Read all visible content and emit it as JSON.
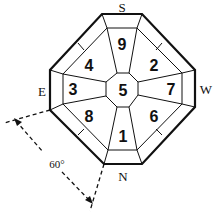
{
  "diagram": {
    "directions": {
      "top": "S",
      "right": "W",
      "bottom": "N",
      "left": "E"
    },
    "sectors": [
      {
        "id": "center",
        "label": "5"
      },
      {
        "id": "top",
        "label": "9"
      },
      {
        "id": "top-right",
        "label": "2"
      },
      {
        "id": "right",
        "label": "7"
      },
      {
        "id": "bottom-right",
        "label": "6"
      },
      {
        "id": "bottom",
        "label": "1"
      },
      {
        "id": "bottom-left",
        "label": "8"
      },
      {
        "id": "left",
        "label": "3"
      },
      {
        "id": "top-left",
        "label": "4"
      }
    ],
    "angle_label": "60°"
  }
}
